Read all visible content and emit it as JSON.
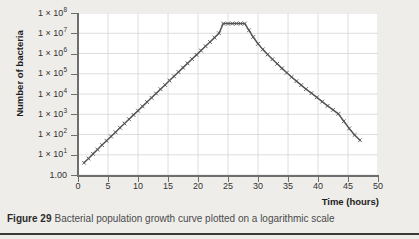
{
  "figure": {
    "caption_label": "Figure 29",
    "caption_text": "Bacterial population growth curve plotted on a logarithmic scale"
  },
  "chart_data": {
    "type": "line",
    "title": "",
    "subtitle": "",
    "xlabel": "Time (hours)",
    "ylabel": "Number of bacteria",
    "grid": true,
    "legend": false,
    "legend_position": "none",
    "yscale": "log",
    "xscale": "linear",
    "xlim": [
      0,
      50
    ],
    "ylim": [
      1,
      100000000
    ],
    "xticks": [
      0,
      5,
      10,
      15,
      20,
      25,
      30,
      35,
      40,
      45,
      50
    ],
    "xtick_labels": [
      "0",
      "5",
      "10",
      "15",
      "20",
      "25",
      "30",
      "35",
      "40",
      "45",
      "50"
    ],
    "yticks": [
      1,
      10,
      100,
      1000,
      10000,
      100000,
      1000000,
      10000000,
      100000000
    ],
    "ytick_labels": [
      {
        "mantissa": "1.00",
        "exponent": ""
      },
      {
        "mantissa": "1 × 10",
        "exponent": "1"
      },
      {
        "mantissa": "1 × 10",
        "exponent": "2"
      },
      {
        "mantissa": "1 × 10",
        "exponent": "3"
      },
      {
        "mantissa": "1 × 10",
        "exponent": "4"
      },
      {
        "mantissa": "1 × 10",
        "exponent": "5"
      },
      {
        "mantissa": "1 × 10",
        "exponent": "6"
      },
      {
        "mantissa": "1 × 10",
        "exponent": "7"
      },
      {
        "mantissa": "1 × 10",
        "exponent": "8"
      }
    ],
    "series": [
      {
        "name": "Bacterial population",
        "marker": "x",
        "color": "#555555",
        "x": [
          1.0,
          1.75,
          2.5,
          3.25,
          4.0,
          4.75,
          5.5,
          6.25,
          7.0,
          7.75,
          8.5,
          9.25,
          10.0,
          10.75,
          11.5,
          12.25,
          13.0,
          13.75,
          14.5,
          15.25,
          16.0,
          16.75,
          17.5,
          18.25,
          19.0,
          19.75,
          20.5,
          21.25,
          22.0,
          22.75,
          23.5,
          24.2,
          25.0,
          25.7,
          26.4,
          27.1,
          27.8,
          28.5,
          29.2,
          30.0,
          30.8,
          31.6,
          32.4,
          33.2,
          34.0,
          34.8,
          35.6,
          36.4,
          37.2,
          38.0,
          38.9,
          39.8,
          40.7,
          41.6,
          42.5,
          43.4,
          44.3,
          45.2,
          46.1,
          47.0
        ],
        "y": [
          4,
          6.5,
          11,
          18,
          30,
          49,
          80,
          130,
          215,
          350,
          570,
          930,
          1500,
          2450,
          4000,
          6500,
          10600,
          17300,
          28000,
          46000,
          75000,
          122000,
          200000,
          325000,
          530000,
          860000,
          1400000,
          2300000,
          3700000,
          6100000,
          10000000,
          30000000,
          30000000,
          30000000,
          30000000,
          30000000,
          30000000,
          14000000,
          6500000,
          3000000,
          1600000,
          900000,
          520000,
          310000,
          185000,
          112000,
          69000,
          43000,
          27500,
          17500,
          11000,
          6800,
          4200,
          2600,
          1650,
          1050,
          450,
          200,
          95,
          52
        ]
      }
    ]
  },
  "icons": {
    "chart_marker": "cross-marker"
  }
}
